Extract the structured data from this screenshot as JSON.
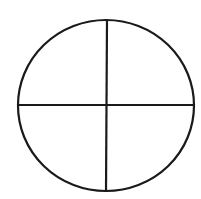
{
  "diagram": {
    "type": "circle-quadrants",
    "background": "#ffffff",
    "stroke_color": "#1a1a1a",
    "stroke_width": 2.2,
    "ellipse": {
      "cx": 106,
      "cy": 105.5,
      "rx": 88,
      "ry": 85.5
    },
    "horizontal_line": {
      "x1": 18,
      "y1": 105,
      "x2": 194,
      "y2": 105
    },
    "vertical_line": {
      "x1": 107,
      "y1": 20,
      "x2": 106,
      "y2": 191
    },
    "quadrants": [
      "top-left",
      "top-right",
      "bottom-left",
      "bottom-right"
    ]
  }
}
